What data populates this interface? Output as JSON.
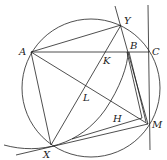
{
  "diagram": {
    "type": "geometry",
    "circle": {
      "cx": 91,
      "cy": 88,
      "r": 69
    },
    "points": {
      "A": {
        "x": 31,
        "y": 52,
        "label": "A",
        "lx": 19,
        "ly": 55
      },
      "Y": {
        "x": 121,
        "y": 25,
        "label": "Y",
        "lx": 124,
        "ly": 24
      },
      "B": {
        "x": 128,
        "y": 52,
        "label": "B",
        "lx": 130,
        "ly": 49
      },
      "C": {
        "x": 149,
        "y": 52,
        "label": "C",
        "lx": 152,
        "ly": 55
      },
      "K": {
        "x": 107,
        "y": 52,
        "label": "K",
        "lx": 103,
        "ly": 64
      },
      "L": {
        "x": 87,
        "y": 87,
        "label": "L",
        "lx": 83,
        "ly": 101
      },
      "H": {
        "x": 130,
        "y": 114,
        "label": "H",
        "lx": 113,
        "ly": 122
      },
      "M": {
        "x": 148,
        "y": 124,
        "label": "M",
        "lx": 152,
        "ly": 128
      },
      "X": {
        "x": 51,
        "y": 145,
        "label": "X",
        "lx": 43,
        "ly": 158
      }
    }
  }
}
